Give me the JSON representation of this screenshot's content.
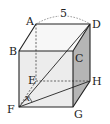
{
  "figure": {
    "type": "cube",
    "edge_label": "5",
    "angle_label": "x",
    "vertices": {
      "A": "A",
      "B": "B",
      "C": "C",
      "D": "D",
      "E": "E",
      "F": "F",
      "G": "G",
      "H": "H"
    },
    "colors": {
      "front_face": "#ececec",
      "right_face": "#b4b4b4",
      "top_face": "#f6f6f6",
      "edge": "#222222",
      "hidden_edge": "#444444"
    }
  }
}
